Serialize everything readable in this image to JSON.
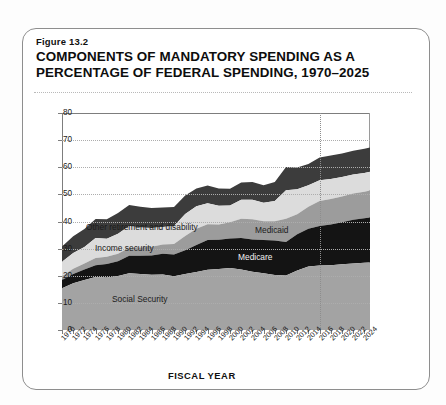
{
  "figure": {
    "number": "Figure 13.2",
    "title": "COMPONENTS OF MANDATORY SPENDING AS A PERCENTAGE OF FEDERAL SPENDING, 1970–2025"
  },
  "chart_data": {
    "type": "area",
    "stacked": true,
    "title": "COMPONENTS OF MANDATORY SPENDING AS A PERCENTAGE OF FEDERAL SPENDING, 1970–2025",
    "xlabel": "FISCAL YEAR",
    "ylabel": "PERCENTAGE OF TOTAL SPENDING",
    "ylim": [
      0,
      80
    ],
    "yticks": [
      0,
      10,
      20,
      30,
      40,
      50,
      60,
      70,
      80
    ],
    "xlim": [
      1970,
      2025
    ],
    "grid": "horizontal-dotted",
    "legend": "inline-annotations",
    "xticks": [
      "1970",
      "1972",
      "1974",
      "1976",
      "1978",
      "1980",
      "1982",
      "1984",
      "1986",
      "1988",
      "1990",
      "1992",
      "1994",
      "1996",
      "1998",
      "2000",
      "2002",
      "2004",
      "2006",
      "2008",
      "2010",
      "2012",
      "2014",
      "2016",
      "2018",
      "2020",
      "2022",
      "2024"
    ],
    "annotations": [
      {
        "text": "Projection divider",
        "x": 2016,
        "style": "vertical dotted line"
      }
    ],
    "x": [
      1970,
      1972,
      1974,
      1976,
      1978,
      1980,
      1982,
      1984,
      1986,
      1988,
      1990,
      1992,
      1994,
      1996,
      1998,
      2000,
      2002,
      2004,
      2006,
      2008,
      2010,
      2012,
      2014,
      2016,
      2018,
      2020,
      2022,
      2024,
      2025
    ],
    "series": [
      {
        "name": "Social Security",
        "color": "#a3a3a3",
        "values": [
          15.4,
          17.2,
          18.4,
          19.5,
          19.4,
          19.9,
          20.9,
          20.6,
          20.4,
          20.5,
          19.8,
          20.6,
          21.4,
          22.2,
          22.5,
          22.9,
          22.3,
          21.5,
          20.9,
          20.3,
          20.1,
          21.9,
          23.4,
          23.8,
          23.9,
          24.2,
          24.5,
          24.8,
          24.9
        ]
      },
      {
        "name": "Medicare",
        "color": "#141414",
        "values": [
          3.0,
          3.4,
          3.9,
          4.4,
          4.9,
          5.4,
          6.5,
          6.8,
          7.1,
          7.6,
          8.0,
          8.8,
          9.9,
          11.0,
          10.8,
          10.8,
          11.6,
          11.9,
          12.3,
          12.7,
          12.3,
          13.4,
          13.9,
          14.5,
          15.0,
          15.5,
          16.1,
          16.4,
          16.6
        ]
      },
      {
        "name": "Medicaid",
        "color": "#9c9c9c",
        "values": [
          1.4,
          2.0,
          2.2,
          2.6,
          2.7,
          2.8,
          2.9,
          3.0,
          3.2,
          3.4,
          3.9,
          5.3,
          6.0,
          5.8,
          5.6,
          6.0,
          7.1,
          7.4,
          6.9,
          7.1,
          8.6,
          7.4,
          8.1,
          9.3,
          9.4,
          9.5,
          9.7,
          9.8,
          9.9
        ]
      },
      {
        "name": "Income security",
        "color": "#dcdcdc",
        "values": [
          5.4,
          5.8,
          6.1,
          7.4,
          6.6,
          7.4,
          8.0,
          7.4,
          6.9,
          6.5,
          6.6,
          8.1,
          8.3,
          7.7,
          6.9,
          6.2,
          7.0,
          7.2,
          6.8,
          7.5,
          10.5,
          9.2,
          8.0,
          7.6,
          7.4,
          7.2,
          7.0,
          6.9,
          6.9
        ]
      },
      {
        "name": "Other retirement and disability",
        "color": "#3c3c3c",
        "values": [
          5.6,
          6.2,
          6.6,
          7.0,
          7.2,
          7.6,
          7.8,
          7.6,
          7.4,
          7.2,
          7.0,
          6.8,
          6.6,
          6.6,
          6.4,
          6.2,
          6.4,
          6.6,
          6.5,
          7.0,
          8.6,
          8.0,
          7.8,
          8.4,
          8.6,
          8.7,
          8.8,
          8.9,
          9.0
        ]
      }
    ],
    "labels_on_plot": [
      {
        "text": "Other retirement and disability",
        "series": "Other retirement and disability"
      },
      {
        "text": "Income security",
        "series": "Income security"
      },
      {
        "text": "Medicaid",
        "series": "Medicaid"
      },
      {
        "text": "Medicare",
        "series": "Medicare"
      },
      {
        "text": "Social Security",
        "series": "Social Security"
      }
    ]
  }
}
